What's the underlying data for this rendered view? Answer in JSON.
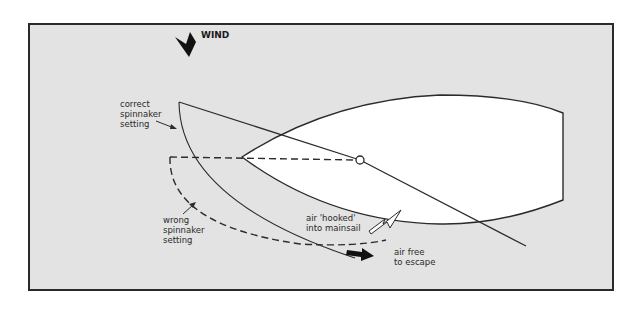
{
  "diagram": {
    "colors": {
      "background": "#e3e3e3",
      "frame": "#2a2a2a",
      "hull_fill": "#ffffff",
      "line": "#2b2b2b"
    },
    "wind": {
      "label": "WIND",
      "icon": "wind-arrow-down"
    },
    "labels": {
      "correct": [
        "correct",
        "spinnaker",
        "setting"
      ],
      "wrong": [
        "wrong",
        "spinnaker",
        "setting"
      ],
      "hooked": [
        "air 'hooked'",
        "into mainsail"
      ],
      "free": [
        "air free",
        "to escape"
      ]
    }
  }
}
